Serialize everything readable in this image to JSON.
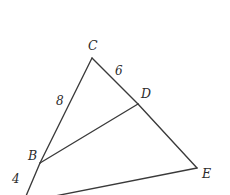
{
  "figure": {
    "type": "geometry-diagram",
    "canvas": {
      "width": 230,
      "height": 195,
      "background": "#ffffff"
    },
    "stroke_color": "#3a3a3a",
    "text_color": "#2b2b2b",
    "vertices": [
      {
        "id": "C",
        "label": "C",
        "x": 92,
        "y": 58,
        "label_x": 88,
        "label_y": 40
      },
      {
        "id": "D",
        "label": "D",
        "x": 138,
        "y": 104,
        "label_x": 141,
        "label_y": 88
      },
      {
        "id": "B",
        "label": "B",
        "x": 40,
        "y": 163,
        "label_x": 28,
        "label_y": 150
      },
      {
        "id": "E",
        "label": "E",
        "x": 197,
        "y": 168,
        "label_x": 202,
        "label_y": 168
      }
    ],
    "segments": [
      {
        "id": "CB",
        "from": "C",
        "to": "B",
        "x1": 92,
        "y1": 58,
        "x2": 40,
        "y2": 163
      },
      {
        "id": "CD",
        "from": "C",
        "to": "D",
        "x1": 92,
        "y1": 58,
        "x2": 138,
        "y2": 104
      },
      {
        "id": "DE",
        "from": "D",
        "to": "E",
        "x1": 138,
        "y1": 104,
        "x2": 197,
        "y2": 168
      },
      {
        "id": "BD",
        "from": "B",
        "to": "D",
        "x1": 40,
        "y1": 163,
        "x2": 138,
        "y2": 104
      },
      {
        "id": "BA",
        "from": "B",
        "to": "A",
        "x1": 40,
        "y1": 163,
        "x2": 26,
        "y2": 196
      },
      {
        "id": "AE",
        "from": "A",
        "to": "E",
        "x1": 55,
        "y1": 196,
        "x2": 197,
        "y2": 168
      }
    ],
    "length_labels": [
      {
        "id": "CD-length",
        "segment": "CD",
        "value": "6",
        "x": 115,
        "y": 65
      },
      {
        "id": "CB-length",
        "segment": "CB",
        "value": "8",
        "x": 56,
        "y": 95
      },
      {
        "id": "BA-length",
        "segment": "BA",
        "value": "4",
        "x": 12,
        "y": 173
      }
    ]
  }
}
